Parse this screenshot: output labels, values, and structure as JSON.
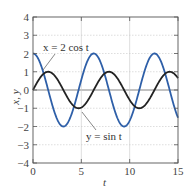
{
  "chart_data": {
    "type": "line",
    "title": "",
    "xlabel": "t",
    "ylabel": "x, y",
    "xlim": [
      0,
      15
    ],
    "ylim": [
      -4,
      4
    ],
    "xticks": [
      0,
      5,
      10,
      15
    ],
    "yticks": [
      -4,
      -3,
      -2,
      -1,
      0,
      1,
      2,
      3,
      4
    ],
    "grid": true,
    "legend": "none (inline annotations)",
    "series": [
      {
        "name": "x = 2 cos t",
        "expression": "2*cos(t)",
        "color": "#2e5fa8",
        "x": [
          0,
          1.571,
          3.142,
          4.712,
          6.283,
          7.854,
          9.425,
          10.996,
          12.566,
          14.137,
          15
        ],
        "values": [
          2,
          0,
          -2,
          0,
          2,
          0,
          -2,
          0,
          2,
          0,
          -1.52
        ]
      },
      {
        "name": "y = sin t",
        "expression": "sin(t)",
        "color": "#222222",
        "x": [
          0,
          1.571,
          3.142,
          4.712,
          6.283,
          7.854,
          9.425,
          10.996,
          12.566,
          14.137,
          15
        ],
        "values": [
          0,
          1,
          0,
          -1,
          0,
          1,
          0,
          -1,
          0,
          1,
          0.65
        ]
      }
    ],
    "annotations": [
      {
        "text": "x = 2 cos t",
        "target_series": "x = 2 cos t",
        "pos": [
          3.5,
          2.5
        ]
      },
      {
        "text": "y = sin t",
        "target_series": "y = sin t",
        "pos": [
          8.5,
          -2.8
        ]
      }
    ]
  },
  "labels": {
    "xlabel": "t",
    "ylabel": "x, y",
    "anno_x": "x = 2 cos t",
    "anno_y": "y = sin t"
  }
}
